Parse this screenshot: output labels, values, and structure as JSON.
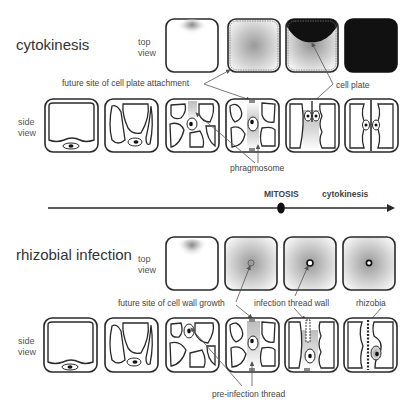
{
  "sections": [
    {
      "title": "cytokinesis",
      "top_view_label": [
        "top",
        "view"
      ],
      "side_view_label": [
        "side",
        "view"
      ],
      "annotations": {
        "attachment": "future site of cell plate attachment",
        "cell_plate": "cell plate",
        "vacuole": "vacuole",
        "phragmosome": "phragmosome"
      }
    },
    {
      "title": "rhizobial infection",
      "top_view_label": [
        "top",
        "view"
      ],
      "side_view_label": [
        "side",
        "view"
      ],
      "annotations": {
        "wall_growth": "future site of cell wall growth",
        "thread_wall": "infection thread wall",
        "rhizobia": "rhizobia",
        "pre_thread": "pre-infection thread"
      }
    }
  ],
  "timeline": {
    "mitosis": "MITOSIS",
    "cytokinesis": "cytokinesis"
  },
  "colors": {
    "outline": "#2a2a2a",
    "shade": "#9a9a9a",
    "dark_fill": "#111111",
    "arrow": "#555555"
  }
}
